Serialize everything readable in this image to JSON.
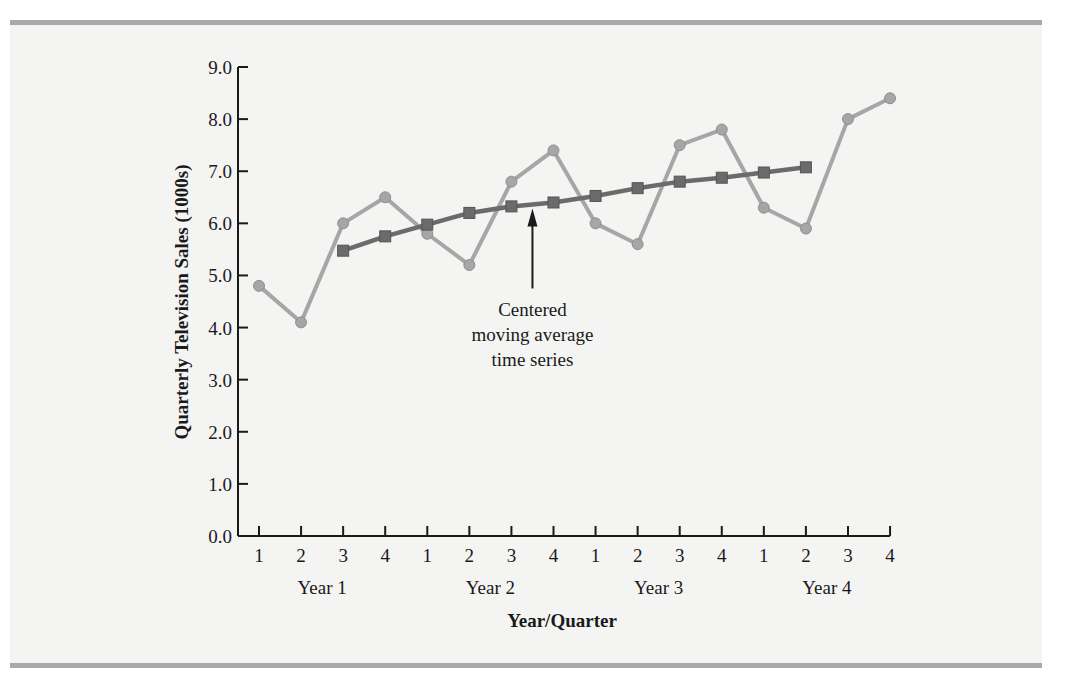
{
  "chart_data": {
    "type": "line",
    "title": "",
    "xlabel": "Year/Quarter",
    "ylabel": "Quarterly Television Sales (1000s)",
    "ylim": [
      0,
      9
    ],
    "yticks": [
      "0.0",
      "1.0",
      "2.0",
      "3.0",
      "4.0",
      "5.0",
      "6.0",
      "7.0",
      "8.0",
      "9.0"
    ],
    "grid": false,
    "legend": "none",
    "quarter_labels": [
      "1",
      "2",
      "3",
      "4",
      "1",
      "2",
      "3",
      "4",
      "1",
      "2",
      "3",
      "4",
      "1",
      "2",
      "3",
      "4"
    ],
    "year_labels": [
      "Year 1",
      "Year 2",
      "Year 3",
      "Year 4"
    ],
    "x": [
      "Y1Q1",
      "Y1Q2",
      "Y1Q3",
      "Y1Q4",
      "Y2Q1",
      "Y2Q2",
      "Y2Q3",
      "Y2Q4",
      "Y3Q1",
      "Y3Q2",
      "Y3Q3",
      "Y3Q4",
      "Y4Q1",
      "Y4Q2",
      "Y4Q3",
      "Y4Q4"
    ],
    "series": [
      {
        "name": "Quarterly Television Sales",
        "marker": "circle",
        "color": "#a6a6a6",
        "values": [
          4.8,
          4.1,
          6.0,
          6.5,
          5.8,
          5.2,
          6.8,
          7.4,
          6.0,
          5.6,
          7.5,
          7.8,
          6.3,
          5.9,
          8.0,
          8.4
        ]
      },
      {
        "name": "Centered moving average time series",
        "marker": "square",
        "color": "#6b6b6b",
        "values": [
          null,
          null,
          5.475,
          5.75,
          5.975,
          6.2,
          6.325,
          6.4,
          6.525,
          6.675,
          6.8,
          6.875,
          6.975,
          7.075,
          null,
          null
        ]
      }
    ],
    "annotations": [
      {
        "text_lines": [
          "Centered",
          "moving average",
          "time series"
        ],
        "arrow_to": "Y2Q3.5",
        "points_at_series": "Centered moving average time series"
      }
    ]
  }
}
